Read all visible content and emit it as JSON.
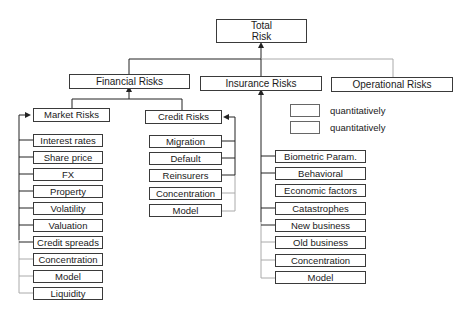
{
  "root": {
    "line1": "Total",
    "line2": "Risk"
  },
  "level1": {
    "financial": "Financial Risks",
    "insurance": "Insurance Risks",
    "operational": "Operational Risks"
  },
  "financial": {
    "market": {
      "label": "Market Risks",
      "items": [
        "Interest rates",
        "Share price",
        "FX",
        "Property",
        "Volatility",
        "Valuation",
        "Credit spreads",
        "Concentration",
        "Model",
        "Liquidity"
      ]
    },
    "credit": {
      "label": "Credit Risks",
      "items": [
        "Migration",
        "Default",
        "Reinsurers",
        "Concentration",
        "Model"
      ]
    }
  },
  "insurance": {
    "items": [
      "Biometric Param.",
      "Behavioral",
      "Economic factors",
      "Catastrophes",
      "New business",
      "Old business",
      "Concentration",
      "Model"
    ]
  },
  "legend": [
    {
      "label": "quantitatively",
      "line_color": "#222222"
    },
    {
      "label": "quantitatively",
      "line_color": "#aaaaaa"
    }
  ],
  "colors": {
    "quantitative_line": "#222222",
    "qualitative_line": "#aaaaaa",
    "box_border": "#3a3a3a"
  }
}
